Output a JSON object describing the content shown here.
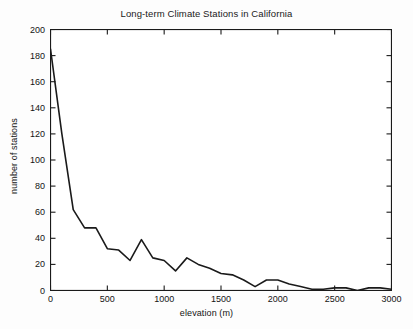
{
  "chart_data": {
    "type": "line",
    "title": "Long-term Climate Stations in California",
    "xlabel": "elevation (m)",
    "ylabel": "number of stations",
    "xlim": [
      0,
      3000
    ],
    "ylim": [
      0,
      200
    ],
    "xticks": [
      0,
      500,
      1000,
      1500,
      2000,
      2500,
      3000
    ],
    "yticks": [
      0,
      20,
      40,
      60,
      80,
      100,
      120,
      140,
      160,
      180,
      200
    ],
    "grid": false,
    "legend": null,
    "line_color": "#1a1a1a",
    "x": [
      0,
      100,
      200,
      300,
      400,
      500,
      600,
      700,
      800,
      900,
      1000,
      1100,
      1200,
      1300,
      1400,
      1500,
      1600,
      1700,
      1800,
      1900,
      2000,
      2100,
      2200,
      2300,
      2400,
      2500,
      2600,
      2700,
      2800,
      2900,
      3000
    ],
    "values": [
      185,
      120,
      62,
      48,
      48,
      32,
      31,
      23,
      39,
      25,
      23,
      15,
      25,
      20,
      17,
      13,
      12,
      8,
      3,
      8,
      8,
      5,
      3,
      1,
      1,
      2,
      2,
      0,
      2,
      2,
      1
    ],
    "series": [
      {
        "name": "number of stations",
        "values": [
          185,
          120,
          62,
          48,
          48,
          32,
          31,
          23,
          39,
          25,
          23,
          15,
          25,
          20,
          17,
          13,
          12,
          8,
          3,
          8,
          8,
          5,
          3,
          1,
          1,
          2,
          2,
          0,
          2,
          2,
          1
        ]
      }
    ]
  }
}
